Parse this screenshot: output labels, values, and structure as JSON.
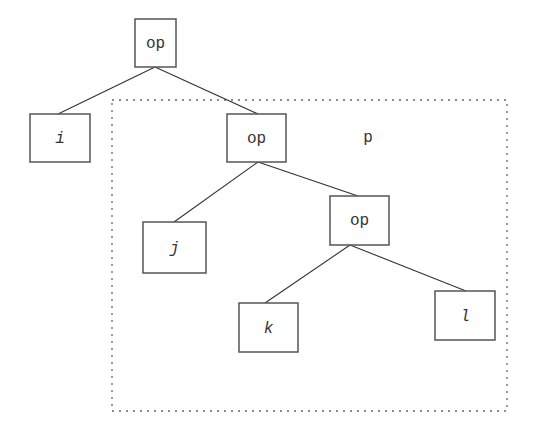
{
  "diagram": {
    "type": "tree",
    "region": {
      "label": "p",
      "x": 112,
      "y": 100,
      "w": 395,
      "h": 311
    },
    "nodes": [
      {
        "id": "root-op",
        "label": "op",
        "italic": false,
        "x": 135,
        "y": 19,
        "w": 41,
        "h": 48
      },
      {
        "id": "leaf-i",
        "label": "i",
        "italic": true,
        "x": 30,
        "y": 114,
        "w": 60,
        "h": 48
      },
      {
        "id": "mid-op",
        "label": "op",
        "italic": false,
        "x": 227,
        "y": 114,
        "w": 59,
        "h": 48
      },
      {
        "id": "leaf-j",
        "label": "j",
        "italic": true,
        "x": 143,
        "y": 222,
        "w": 63,
        "h": 51
      },
      {
        "id": "low-op",
        "label": "op",
        "italic": false,
        "x": 330,
        "y": 196,
        "w": 59,
        "h": 49
      },
      {
        "id": "leaf-k",
        "label": "k",
        "italic": true,
        "x": 239,
        "y": 303,
        "w": 59,
        "h": 49
      },
      {
        "id": "leaf-l",
        "label": "l",
        "italic": true,
        "x": 435,
        "y": 291,
        "w": 60,
        "h": 49
      }
    ],
    "edges": [
      {
        "from": "root-op",
        "to": "leaf-i"
      },
      {
        "from": "root-op",
        "to": "mid-op"
      },
      {
        "from": "mid-op",
        "to": "leaf-j"
      },
      {
        "from": "mid-op",
        "to": "low-op"
      },
      {
        "from": "low-op",
        "to": "leaf-k"
      },
      {
        "from": "low-op",
        "to": "leaf-l"
      }
    ]
  },
  "labels": {
    "root": "op",
    "i": "i",
    "mid": "op",
    "j": "j",
    "low": "op",
    "k": "k",
    "l": "l",
    "region": "p"
  }
}
